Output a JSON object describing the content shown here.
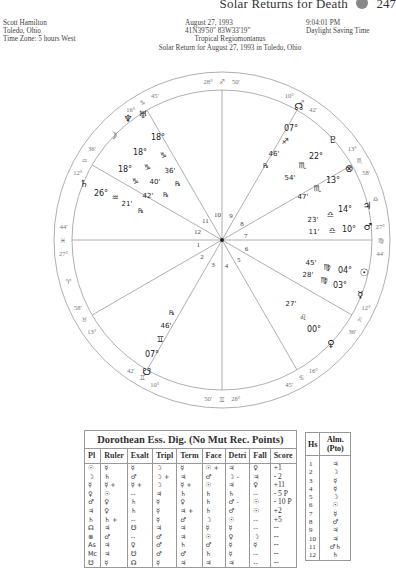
{
  "page_header": {
    "title": "Solar Returns for Death",
    "page_number": "247"
  },
  "chart_info": {
    "name": "Scott Hamilton",
    "location": "Toledo, Ohio",
    "time_zone": "Time Zone: 5 hours West",
    "date": "August 27, 1993",
    "coordinates": "41N39'50\"  83W33'19\"",
    "system": "Tropical Regiomontanus",
    "caption": "Solar Return for August 27, 1993 in Toledo, Ohio",
    "time": "9:04:01 PM",
    "dst": "Daylight Saving Time"
  },
  "wheel": {
    "cusps": [
      {
        "house": 1,
        "deg": "27°",
        "sign": "♓",
        "min": "44'",
        "angle": 180
      },
      {
        "house": 2,
        "deg": "13°",
        "sign": "♉",
        "min": "58'",
        "angle": 210
      },
      {
        "house": 3,
        "deg": "10°",
        "sign": "♊",
        "min": "42'",
        "angle": 240
      },
      {
        "house": 4,
        "deg": "28°",
        "sign": "♊",
        "min": "50'",
        "angle": 270
      },
      {
        "house": 5,
        "deg": "16°",
        "sign": "♋",
        "min": "45'",
        "angle": 300
      },
      {
        "house": 6,
        "deg": "12°",
        "sign": "♌",
        "min": "36'",
        "angle": 330
      },
      {
        "house": 7,
        "deg": "27°",
        "sign": "♍",
        "min": "44'",
        "angle": 0
      },
      {
        "house": 8,
        "deg": "13°",
        "sign": "♏",
        "min": "58'",
        "angle": 30
      },
      {
        "house": 9,
        "deg": "10°",
        "sign": "♐",
        "min": "42'",
        "angle": 60
      },
      {
        "house": 10,
        "deg": "28°",
        "sign": "♐",
        "min": "50'",
        "angle": 90
      },
      {
        "house": 11,
        "deg": "16°",
        "sign": "♑",
        "min": "45'",
        "angle": 120
      },
      {
        "house": 12,
        "deg": "12°",
        "sign": "♒",
        "min": "36'",
        "angle": 150
      }
    ],
    "intercepted": [
      {
        "sign": "♈",
        "angle": 195
      },
      {
        "sign": "♎",
        "angle": 15
      }
    ],
    "planets": [
      {
        "name": "Uranus",
        "glyph": "♅",
        "deg": "18°",
        "sign": "♑",
        "min": "36'",
        "retro": "℞"
      },
      {
        "name": "Neptune",
        "glyph": "♆",
        "deg": "18°",
        "sign": "♑",
        "min": "40'",
        "retro": "℞"
      },
      {
        "name": "Moon",
        "glyph": "☽",
        "deg": "18°",
        "sign": "♑",
        "min": "42'",
        "retro": ""
      },
      {
        "name": "Saturn",
        "glyph": "♄",
        "deg": "26°",
        "sign": "♒",
        "min": "21'",
        "retro": "℞"
      },
      {
        "name": "North Node",
        "glyph": "☊",
        "deg": "07°",
        "sign": "♐",
        "min": "46'",
        "retro": "℞"
      },
      {
        "name": "Pluto",
        "glyph": "♇",
        "deg": "22°",
        "sign": "♏",
        "min": "54'",
        "retro": ""
      },
      {
        "name": "Part of Fortune",
        "glyph": "⊗",
        "deg": "13°",
        "sign": "♏",
        "min": "47'",
        "retro": ""
      },
      {
        "name": "Jupiter",
        "glyph": "♃",
        "deg": "14°",
        "sign": "♎",
        "min": "23'",
        "retro": ""
      },
      {
        "name": "Mars",
        "glyph": "♂",
        "deg": "10°",
        "sign": "♎",
        "min": "11'",
        "retro": ""
      },
      {
        "name": "Sun",
        "glyph": "☉",
        "deg": "04°",
        "sign": "♍",
        "min": "45'",
        "retro": ""
      },
      {
        "name": "Mercury",
        "glyph": "☿",
        "deg": "03°",
        "sign": "♍",
        "min": "28'",
        "retro": ""
      },
      {
        "name": "Venus",
        "glyph": "♀",
        "deg": "00°",
        "sign": "♌",
        "min": "27'",
        "retro": ""
      },
      {
        "name": "South Node",
        "glyph": "☋",
        "deg": "07°",
        "sign": "♊",
        "min": "46'",
        "retro": "℞"
      }
    ]
  },
  "dignities_table": {
    "title": "Dorothean Ess. Dig. (No Mut Rec. Points)",
    "columns": [
      "Pl",
      "Ruler",
      "Exalt",
      "Tripl",
      "Term",
      "Face",
      "Detri",
      "Fall",
      "Score"
    ],
    "rows": [
      [
        "☉",
        "☿",
        "☿",
        "☽",
        "☿",
        "☉ +",
        "♃",
        "♀",
        "+1"
      ],
      [
        "☽",
        "♄",
        "♂",
        "☽ +",
        "♃",
        "♂",
        "☽ -",
        "♃",
        "- 2"
      ],
      [
        "☿",
        "☿ +",
        "☿ +",
        "☽",
        "☿ +",
        "☉",
        "♃",
        "♀",
        "+11"
      ],
      [
        "♀",
        "☉",
        "--",
        "♃",
        "♄",
        "♄",
        "♄",
        "--",
        "- 5 P"
      ],
      [
        "♂",
        "♀",
        "♄",
        "☿",
        "♀",
        "♄",
        "♂ -",
        "☉",
        "- 10 P"
      ],
      [
        "♃",
        "♀",
        "♄",
        "☿",
        "♃ +",
        "♄",
        "♂",
        "☉",
        "+2"
      ],
      [
        "♄",
        "♄ +",
        "--",
        "☿",
        "♂",
        "☽",
        "☉",
        "--",
        "+5"
      ],
      [
        "☊",
        "♃",
        "☋",
        "♃",
        "♃",
        "☿",
        "☿",
        "--",
        "--"
      ],
      [
        "⊗",
        "♂",
        "--",
        "♂",
        "♃",
        "☉",
        "♀",
        "☽",
        "--"
      ],
      [
        "As",
        "♃",
        "♀",
        "♂",
        "♄",
        "♂",
        "☿",
        "☿",
        "--"
      ],
      [
        "Mc",
        "♃",
        "☋",
        "♂",
        "♂",
        "♄",
        "☿",
        "--",
        "--"
      ],
      [
        "☋",
        "☿",
        "☊",
        "☿",
        "♃",
        "♃",
        "♃",
        "--",
        "--"
      ]
    ]
  },
  "almuten_table": {
    "columns": [
      "Hs",
      "Alm. (Pto)"
    ],
    "rows": [
      [
        "1",
        "♃"
      ],
      [
        "2",
        "☽"
      ],
      [
        "3",
        "☿"
      ],
      [
        "4",
        "☿"
      ],
      [
        "5",
        "☽"
      ],
      [
        "6",
        "☉"
      ],
      [
        "7",
        "☿"
      ],
      [
        "8",
        "♂"
      ],
      [
        "9",
        "♃"
      ],
      [
        "10",
        "♃"
      ],
      [
        "11",
        "♂♄"
      ],
      [
        "12",
        "♄"
      ]
    ]
  }
}
